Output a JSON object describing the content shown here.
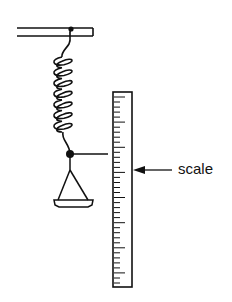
{
  "diagram": {
    "type": "spring-balance-apparatus",
    "components": {
      "support": "horizontal-bar",
      "spring": {
        "coils": 7
      },
      "pointer": "horizontal-pointer",
      "pan": "triangular-hanger-pan",
      "ruler": {
        "ticks": 38
      }
    },
    "labels": {
      "scale": "scale"
    },
    "colors": {
      "stroke": "#111111",
      "background": "#ffffff"
    }
  }
}
